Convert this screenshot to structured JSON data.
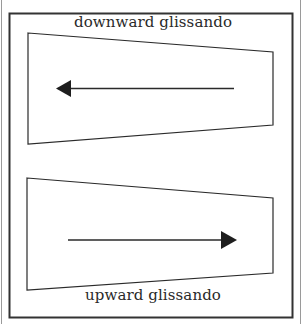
{
  "diagram": {
    "top_label": "downward glissando",
    "bottom_label": "upward glissando",
    "colors": {
      "stroke": "#2a2a2a",
      "frame": "#333333",
      "background": "#ffffff"
    },
    "panels": [
      {
        "name": "downward",
        "direction": "left",
        "shape": "trapezoid",
        "points": [
          [
            28,
            33
          ],
          [
            273,
            52
          ],
          [
            273,
            125
          ],
          [
            28,
            144
          ]
        ]
      },
      {
        "name": "upward",
        "direction": "right",
        "shape": "trapezoid",
        "points": [
          [
            27,
            178
          ],
          [
            273,
            198
          ],
          [
            273,
            273
          ],
          [
            27,
            290
          ]
        ]
      }
    ]
  }
}
